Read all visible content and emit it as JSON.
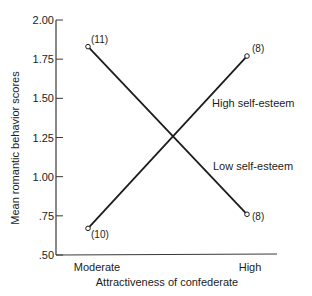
{
  "chart_data": {
    "type": "line",
    "title": "",
    "xlabel": "Attractiveness of confederate",
    "ylabel": "Mean romantic behavior scores",
    "categories": [
      "Moderate",
      "High"
    ],
    "ylim": [
      0.5,
      2.0
    ],
    "yticks": [
      "2.00",
      "1.75",
      "1.50",
      "1.25",
      "1.00",
      ".75",
      ".50"
    ],
    "ytick_values": [
      2.0,
      1.75,
      1.5,
      1.25,
      1.0,
      0.75,
      0.5
    ],
    "grid": false,
    "legend_position": "inline labels",
    "series": [
      {
        "name": "High self-esteem",
        "values": [
          0.67,
          1.77
        ],
        "n_labels": [
          "(10)",
          "(8)"
        ]
      },
      {
        "name": "Low self-esteem",
        "values": [
          1.83,
          0.76
        ],
        "n_labels": [
          "(11)",
          "(8)"
        ]
      }
    ]
  },
  "colors": {
    "line": "#1c1c1c",
    "axis": "#3a3a3a",
    "background": "#ffffff"
  }
}
